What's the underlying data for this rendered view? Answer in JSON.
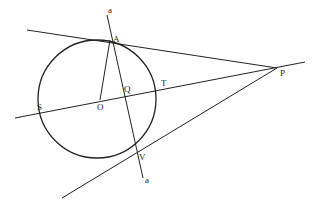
{
  "diagram": {
    "stroke_color": "#222222",
    "background": "#ffffff",
    "circle": {
      "name": "O",
      "cx": 97,
      "cy": 99,
      "r": 59
    },
    "points": {
      "A": {
        "label": "A",
        "x": 110,
        "y": 40
      },
      "P": {
        "label": "P",
        "x": 277,
        "y": 68
      },
      "T": {
        "label": "T",
        "x": 155,
        "y": 85
      },
      "Q": {
        "label": "Q",
        "x": 125,
        "y": 92
      },
      "O": {
        "label": "O",
        "x": 100,
        "y": 100
      },
      "S": {
        "label": "S",
        "x": 39,
        "y": 112
      },
      "V": {
        "label": "V",
        "x": 138,
        "y": 153
      },
      "a_top": {
        "label": "a",
        "x": 107,
        "y": 15
      },
      "a_bottom": {
        "label": "a",
        "x": 143,
        "y": 178
      }
    },
    "lines": [
      {
        "name": "upper-tangent-PA",
        "x1": 27,
        "y1": 30,
        "x2": 277,
        "y2": 68
      },
      {
        "name": "secant-SOTP",
        "x1": 15,
        "y1": 118,
        "x2": 305,
        "y2": 62
      },
      {
        "name": "lower-tangent-PV",
        "x1": 62,
        "y1": 198,
        "x2": 277,
        "y2": 68
      },
      {
        "name": "line-aa",
        "x1": 107,
        "y1": 15,
        "x2": 143,
        "y2": 178
      },
      {
        "name": "radius-OA",
        "x1": 100,
        "y1": 100,
        "x2": 110,
        "y2": 40
      }
    ],
    "labels": [
      {
        "name": "label-a-top",
        "text": "a",
        "x": 108,
        "y": 13
      },
      {
        "name": "label-A",
        "text": "A",
        "x": 113,
        "y": 42
      },
      {
        "name": "label-P",
        "text": "P",
        "x": 280,
        "y": 76
      },
      {
        "name": "label-T",
        "text": "T",
        "x": 161,
        "y": 86
      },
      {
        "name": "label-Q",
        "text": "Q",
        "x": 124,
        "y": 92
      },
      {
        "name": "label-O",
        "text": "O",
        "x": 97,
        "y": 110
      },
      {
        "name": "label-S",
        "text": "S",
        "x": 37,
        "y": 110
      },
      {
        "name": "label-V",
        "text": "V",
        "x": 139,
        "y": 160
      },
      {
        "name": "label-a-bottom",
        "text": "a",
        "x": 145,
        "y": 183
      }
    ]
  }
}
